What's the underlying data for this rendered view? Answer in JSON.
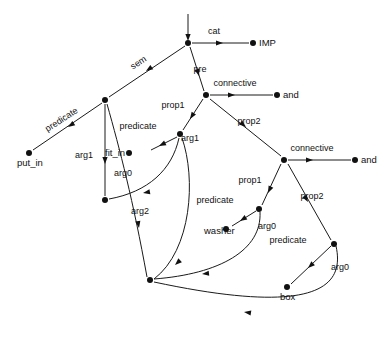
{
  "figure": {
    "type": "directed-graph",
    "width": 391,
    "height": 341,
    "background_color": "#ffffff",
    "stroke_color": "#111111"
  },
  "nodes": [
    {
      "id": "root",
      "name": "root-node",
      "x": 188,
      "y": 43,
      "label": "",
      "label_dx": 0,
      "label_dy": 0,
      "anchor": "start",
      "has_label": false
    },
    {
      "id": "imp",
      "name": "imp-node",
      "x": 253,
      "y": 43,
      "label": "IMP",
      "label_dx": 6,
      "label_dy": 3,
      "anchor": "start",
      "has_label": true
    },
    {
      "id": "semnode",
      "name": "sem-target-node",
      "x": 105,
      "y": 100,
      "label": "",
      "label_dx": 0,
      "label_dy": 0,
      "anchor": "start",
      "has_label": false
    },
    {
      "id": "putin",
      "name": "put-in-node",
      "x": 29,
      "y": 153,
      "label": "put_in",
      "label_dx": -12,
      "label_dy": 13,
      "anchor": "start",
      "has_label": true
    },
    {
      "id": "prenode",
      "name": "pre-connective-node",
      "x": 206,
      "y": 95,
      "label": "",
      "label_dx": 0,
      "label_dy": 0,
      "anchor": "start",
      "has_label": false
    },
    {
      "id": "and1",
      "name": "and-node-upper",
      "x": 277,
      "y": 95,
      "label": "and",
      "label_dx": 6,
      "label_dy": 3,
      "anchor": "start",
      "has_label": true
    },
    {
      "id": "fitinpred",
      "name": "fit-in-predicate-node",
      "x": 180,
      "y": 134,
      "label": "",
      "label_dx": 0,
      "label_dy": 0,
      "anchor": "start",
      "has_label": false
    },
    {
      "id": "fitin",
      "name": "fit-in-node",
      "x": 129,
      "y": 153,
      "label": "fit_in",
      "label_dx": -24,
      "label_dy": 3,
      "anchor": "start",
      "has_label": true
    },
    {
      "id": "arg1node",
      "name": "arg1-target-node",
      "x": 105,
      "y": 200,
      "label": "",
      "label_dx": 0,
      "label_dy": 0,
      "anchor": "start",
      "has_label": false
    },
    {
      "id": "bottomnode",
      "name": "bottom-shared-node",
      "x": 150,
      "y": 280,
      "label": "",
      "label_dx": 0,
      "label_dy": 0,
      "anchor": "start",
      "has_label": false
    },
    {
      "id": "conn2",
      "name": "connective-node-lower",
      "x": 284,
      "y": 160,
      "label": "",
      "label_dx": 0,
      "label_dy": 0,
      "anchor": "start",
      "has_label": false
    },
    {
      "id": "and2",
      "name": "and-node-lower",
      "x": 355,
      "y": 160,
      "label": "and",
      "label_dx": 6,
      "label_dy": 3,
      "anchor": "start",
      "has_label": true
    },
    {
      "id": "washerpred",
      "name": "washer-predicate-node",
      "x": 259,
      "y": 209,
      "label": "",
      "label_dx": 0,
      "label_dy": 0,
      "anchor": "start",
      "has_label": false
    },
    {
      "id": "washer",
      "name": "washer-node",
      "x": 226,
      "y": 229,
      "label": "washer",
      "label_dx": -22,
      "label_dy": 5,
      "anchor": "start",
      "has_label": true
    },
    {
      "id": "boxpred",
      "name": "box-predicate-node",
      "x": 334,
      "y": 244,
      "label": "",
      "label_dx": 0,
      "label_dy": 0,
      "anchor": "start",
      "has_label": false
    },
    {
      "id": "box",
      "name": "box-node",
      "x": 287,
      "y": 287,
      "label": "box",
      "label_dx": -7,
      "label_dy": 13,
      "anchor": "start",
      "has_label": true
    }
  ],
  "edges": [
    {
      "id": "e-entry",
      "name": "entry-arrow",
      "label": "",
      "path": "M 188 14 L 188 38",
      "arrow": {
        "x": 188,
        "y": 41,
        "angle": 90
      },
      "label_x": 0,
      "label_y": 0,
      "rotate": 0
    },
    {
      "id": "e-cat",
      "name": "edge-cat",
      "label": "cat",
      "path": "M 192 43 L 249 43",
      "arrow": {
        "x": 223,
        "y": 43,
        "angle": 0
      },
      "label_x": 214,
      "label_y": 34,
      "rotate": 0
    },
    {
      "id": "e-sem",
      "name": "edge-sem",
      "label": "sem",
      "path": "M 185 46 L 109 97",
      "arrow": {
        "x": 146,
        "y": 71,
        "angle": 146
      },
      "label_x": 140,
      "label_y": 65,
      "rotate": -33
    },
    {
      "id": "e-pre",
      "name": "edge-pre",
      "label": "pre",
      "path": "M 190 47 L 204 91",
      "arrow": {
        "x": 199,
        "y": 76,
        "angle": 73
      },
      "label_x": 200,
      "label_y": 72,
      "rotate": 0
    },
    {
      "id": "e-predicate1",
      "name": "edge-predicate-put-in",
      "label": "predicate",
      "path": "M 102 103 L 33 150",
      "arrow": {
        "x": 68,
        "y": 127,
        "angle": 146
      },
      "label_x": 63,
      "label_y": 122,
      "rotate": -33
    },
    {
      "id": "e-conn1",
      "name": "edge-connective-upper",
      "label": "connective",
      "path": "M 210 95 L 273 95",
      "arrow": {
        "x": 235,
        "y": 95,
        "angle": 0
      },
      "label_x": 235,
      "label_y": 86,
      "rotate": 0
    },
    {
      "id": "e-prop1a",
      "name": "edge-prop1-upper",
      "label": "prop1",
      "path": "M 203 99 L 183 130",
      "arrow": {
        "x": 190,
        "y": 119,
        "angle": 123
      },
      "label_x": 173,
      "label_y": 108,
      "rotate": 0
    },
    {
      "id": "e-prop2a",
      "name": "edge-prop2-upper",
      "label": "prop2",
      "path": "M 210 99 L 281 156",
      "arrow": {
        "x": 246,
        "y": 127,
        "angle": 39
      },
      "label_x": 249,
      "label_y": 124,
      "rotate": 0
    },
    {
      "id": "e-predicate2",
      "name": "edge-predicate-fit-in",
      "label": "predicate",
      "path": "M 177 137 L 151 150",
      "arrow": {
        "x": 159,
        "y": 146,
        "angle": 153
      },
      "label_x": 138,
      "label_y": 129,
      "rotate": 0
    },
    {
      "id": "e-arg0a",
      "name": "edge-arg0-fit-in",
      "label": "arg0",
      "path": "M 179 138 C 172 170 148 192 109 199",
      "arrow": {
        "x": 143,
        "y": 193,
        "angle": 170
      },
      "label_x": 123,
      "label_y": 176,
      "rotate": 0
    },
    {
      "id": "e-arg1a",
      "name": "edge-arg1-fit-in",
      "label": "arg1",
      "path": "M 182 138 C 196 178 192 250 154 279",
      "arrow": {
        "x": 175,
        "y": 265,
        "angle": 137
      },
      "label_x": 190,
      "label_y": 141,
      "rotate": 0
    },
    {
      "id": "e-arg1b",
      "name": "edge-arg1-sem",
      "label": "arg1",
      "path": "M 105 104 L 105 196",
      "arrow": {
        "x": 105,
        "y": 164,
        "angle": 90
      },
      "label_x": 84,
      "label_y": 158,
      "rotate": 0
    },
    {
      "id": "e-arg2",
      "name": "edge-arg2-sem",
      "label": "arg2",
      "path": "M 107 104 C 120 150 133 200 147 277",
      "arrow": {
        "x": 139,
        "y": 228,
        "angle": 80
      },
      "label_x": 140,
      "label_y": 214,
      "rotate": 0
    },
    {
      "id": "e-conn2",
      "name": "edge-connective-lower",
      "label": "connective",
      "path": "M 288 160 L 351 160",
      "arrow": {
        "x": 313,
        "y": 160,
        "angle": 0
      },
      "label_x": 312,
      "label_y": 151,
      "rotate": 0
    },
    {
      "id": "e-prop1b",
      "name": "edge-prop1-lower",
      "label": "prop1",
      "path": "M 281 164 L 262 205",
      "arrow": {
        "x": 268,
        "y": 193,
        "angle": 115
      },
      "label_x": 250,
      "label_y": 183,
      "rotate": 0
    },
    {
      "id": "e-prop2b",
      "name": "edge-prop2-lower",
      "label": "prop2",
      "path": "M 288 164 L 331 240",
      "arrow": {
        "x": 308,
        "y": 202,
        "angle": 60
      },
      "label_x": 312,
      "label_y": 199,
      "rotate": 0
    },
    {
      "id": "e-predicate3",
      "name": "edge-predicate-washer",
      "label": "predicate",
      "path": "M 256 211 L 232 226",
      "arrow": {
        "x": 240,
        "y": 221,
        "angle": 148
      },
      "label_x": 215,
      "label_y": 203,
      "rotate": 0
    },
    {
      "id": "e-arg0b",
      "name": "edge-arg0-washer",
      "label": "arg0",
      "path": "M 260 212 C 262 250 220 274 154 279",
      "arrow": {
        "x": 202,
        "y": 274,
        "angle": 174
      },
      "label_x": 267,
      "label_y": 229,
      "rotate": 0
    },
    {
      "id": "e-predicate4",
      "name": "edge-predicate-box",
      "label": "predicate",
      "path": "M 331 246 L 291 284",
      "arrow": {
        "x": 308,
        "y": 268,
        "angle": 137
      },
      "label_x": 288,
      "label_y": 243,
      "rotate": 0
    },
    {
      "id": "e-arg0c",
      "name": "edge-arg0-box",
      "label": "arg0",
      "path": "M 336 246 C 345 286 318 317 154 282",
      "arrow": {
        "x": 244,
        "y": 312,
        "angle": 188
      },
      "label_x": 340,
      "label_y": 270,
      "rotate": 0
    }
  ]
}
